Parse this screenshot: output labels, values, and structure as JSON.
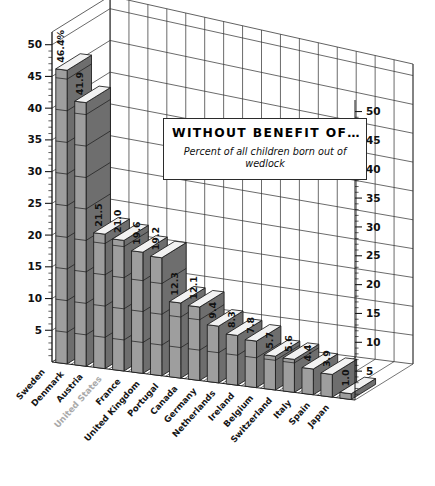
{
  "chart_data": {
    "type": "bar",
    "title": "WITHOUT BENEFIT OF…",
    "subtitle": "Percent of all children born out of wedlock",
    "xlabel": "",
    "ylabel": "",
    "ylim": [
      0,
      52
    ],
    "grid": true,
    "legend": "none",
    "value_suffix_first": "%",
    "style": "3d-column",
    "categories": [
      "Sweden",
      "Denmark",
      "Austria",
      "United States",
      "France",
      "United Kingdom",
      "Portugal",
      "Canada",
      "Germany",
      "Netherlands",
      "Ireland",
      "Belgium",
      "Switzerland",
      "Italy",
      "Spain",
      "Japan"
    ],
    "values": [
      46.4,
      41.9,
      21.5,
      21.0,
      19.6,
      19.2,
      12.3,
      12.1,
      9.4,
      8.3,
      7.8,
      5.7,
      5.6,
      4.4,
      3.9,
      1.0
    ],
    "value_labels": [
      "46.4%",
      "41.9",
      "21.5",
      "21.0",
      "19.6",
      "19.2",
      "12.3",
      "12.1",
      "9.4",
      "8.3",
      "7.8",
      "5.7",
      "5.6",
      "4.4",
      "3.9",
      "1.0"
    ],
    "highlighted_category": "United States",
    "axis_left": {
      "ticks": [
        5,
        10,
        15,
        20,
        25,
        30,
        35,
        40,
        45,
        50
      ],
      "tick_labels": [
        "5",
        "10",
        "15",
        "20",
        "25",
        "30",
        "35",
        "40",
        "45",
        "50"
      ],
      "minor_ticks_per_interval": 5
    },
    "axis_right": {
      "ticks": [
        5,
        10,
        15,
        20,
        25,
        30,
        35,
        40,
        45,
        50
      ],
      "tick_labels": [
        "5",
        "10",
        "15",
        "20",
        "25",
        "30",
        "35",
        "40",
        "45",
        "50"
      ],
      "minor_ticks_per_interval": 5
    }
  },
  "colors": {
    "bar_front": "#9e9e9e",
    "bar_side": "#6e6e6e",
    "bar_top": "#f2f2f2",
    "outline": "#1a1a1a",
    "grid": "#3a3a3a",
    "background": "#ffffff",
    "highlight_label": "#a9a9a9"
  }
}
